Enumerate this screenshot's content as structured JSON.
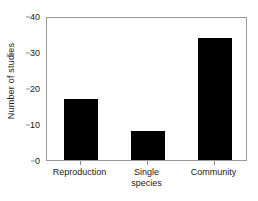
{
  "chart_data": {
    "type": "bar",
    "title": "",
    "xlabel": "",
    "ylabel": "Number of studies",
    "categories": [
      "Reproduction",
      "Single\nspecies",
      "Community"
    ],
    "values": [
      17,
      8,
      34
    ],
    "ylim": [
      0,
      40
    ],
    "yticks": [
      0,
      10,
      20,
      30,
      40
    ],
    "ytick_labels": [
      "0",
      "10",
      "20",
      "30",
      "40"
    ],
    "grid": false,
    "legend": null,
    "bar_color": "#000000",
    "frame_color": "#9a9a9a",
    "background_color": "#ffffff",
    "orientation": "vertical"
  },
  "axes": {
    "y_title": "Number of studies",
    "y_ticks": [
      {
        "value": 40,
        "label": "40"
      },
      {
        "value": 30,
        "label": "30"
      },
      {
        "value": 20,
        "label": "20"
      },
      {
        "value": 10,
        "label": "10"
      },
      {
        "value": 0,
        "label": "0"
      }
    ],
    "x_categories": [
      {
        "label": "Reproduction",
        "value": 17
      },
      {
        "label": "Single\nspecies",
        "value": 8
      },
      {
        "label": "Community",
        "value": 34
      }
    ]
  }
}
